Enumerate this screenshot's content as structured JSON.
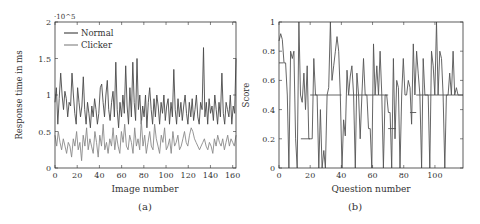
{
  "chart_data": [
    {
      "type": "line",
      "panel_label": "(a)",
      "title": "",
      "xlabel": "Image number",
      "ylabel": "Response time in ms",
      "y_multiplier": "·10^5",
      "xlim": [
        0,
        163
      ],
      "ylim": [
        0,
        2
      ],
      "xticks": [
        0,
        20,
        40,
        60,
        80,
        100,
        120,
        140,
        160
      ],
      "yticks": [
        0,
        0.5,
        1,
        1.5,
        2
      ],
      "ytick_labels": [
        "0",
        "0.5",
        "1",
        "1.5",
        "2"
      ],
      "legend": {
        "position": "upper-left",
        "entries": [
          "Normal",
          "Clicker"
        ]
      },
      "grid": false,
      "series": [
        {
          "name": "Normal",
          "color": "#4a4a4a",
          "values": [
            0.9,
            1.1,
            0.6,
            0.95,
            1.3,
            1.0,
            0.8,
            1.05,
            0.95,
            0.7,
            0.9,
            0.85,
            1.3,
            1.0,
            0.75,
            0.6,
            1.1,
            0.9,
            0.7,
            0.85,
            1.25,
            0.8,
            0.6,
            0.9,
            0.75,
            0.55,
            0.85,
            0.7,
            0.95,
            0.8,
            0.6,
            0.75,
            1.1,
            1.15,
            0.9,
            0.7,
            1.0,
            1.2,
            0.8,
            0.65,
            0.9,
            1.05,
            0.7,
            1.45,
            0.8,
            0.55,
            0.9,
            0.7,
            1.0,
            0.75,
            1.4,
            0.85,
            0.6,
            1.1,
            0.7,
            1.45,
            0.9,
            0.65,
            1.5,
            0.8,
            1.0,
            0.6,
            0.85,
            0.7,
            1.0,
            0.55,
            0.9,
            1.1,
            0.8,
            0.6,
            0.95,
            0.7,
            1.0,
            0.85,
            0.6,
            0.9,
            0.75,
            1.0,
            0.65,
            0.85,
            0.95,
            0.6,
            0.9,
            0.7,
            1.35,
            0.8,
            0.6,
            0.95,
            0.7,
            0.9,
            0.65,
            0.85,
            1.0,
            0.75,
            0.6,
            0.9,
            0.7,
            0.95,
            0.65,
            0.8,
            1.0,
            0.7,
            0.6,
            0.9,
            0.8,
            1.65,
            0.7,
            0.9,
            0.6,
            0.95,
            0.75,
            0.85,
            0.65,
            1.0,
            0.8,
            0.6,
            0.9,
            0.7,
            1.3,
            0.75,
            0.6,
            0.9,
            0.8,
            0.7,
            1.0,
            0.6,
            0.85,
            0.75,
            1.5
          ]
        },
        {
          "name": "Clicker",
          "color": "#8a8a8a",
          "values": [
            0.45,
            0.3,
            0.5,
            0.35,
            0.25,
            0.4,
            0.3,
            0.2,
            0.35,
            0.3,
            0.15,
            0.4,
            0.3,
            0.5,
            0.25,
            0.35,
            0.1,
            0.45,
            0.3,
            0.55,
            0.25,
            0.4,
            0.3,
            0.2,
            0.5,
            0.35,
            0.15,
            0.45,
            0.3,
            0.6,
            0.25,
            0.35,
            0.2,
            0.4,
            0.3,
            0.55,
            0.25,
            0.45,
            0.3,
            0.2,
            0.5,
            0.35,
            0.6,
            0.3,
            0.25,
            0.45,
            0.35,
            0.2,
            0.55,
            0.3,
            0.4,
            0.25,
            0.65,
            0.3,
            0.45,
            0.2,
            0.35,
            0.5,
            0.3,
            0.25,
            0.6,
            0.4,
            0.3,
            0.2,
            0.45,
            0.35,
            0.55,
            0.25,
            0.3,
            0.4,
            0.2,
            0.5,
            0.3,
            0.35,
            0.45,
            0.25,
            0.3,
            0.4,
            0.5,
            0.35,
            0.3,
            0.45,
            0.55,
            0.5,
            0.4,
            0.35,
            0.3,
            0.25,
            0.3,
            0.35,
            0.4,
            0.3,
            0.25,
            0.35,
            0.3,
            0.2,
            0.4,
            0.3,
            0.45,
            0.35,
            0.3,
            0.4,
            0.25,
            0.35,
            0.45,
            0.3,
            0.4,
            0.35,
            0.3,
            0.45
          ]
        }
      ]
    },
    {
      "type": "line",
      "panel_label": "(b)",
      "title": "",
      "xlabel": "Question number",
      "ylabel": "Score",
      "xlim": [
        0,
        118
      ],
      "ylim": [
        0,
        1
      ],
      "xticks": [
        0,
        20,
        40,
        60,
        80,
        100
      ],
      "yticks": [
        0,
        0.2,
        0.4,
        0.6,
        0.8,
        1
      ],
      "ytick_labels": [
        "0",
        "0.2",
        "0.4",
        "0.6",
        "0.8",
        "1"
      ],
      "grid": false,
      "series": [
        {
          "name": "Score",
          "color": "#555555",
          "values": [
            0.87,
            0.92,
            0.88,
            0.72,
            0.72,
            0.5,
            0.0,
            0.8,
            0.75,
            0.8,
            0.2,
            0.0,
            1.0,
            0.5,
            0.45,
            0.65,
            0.4,
            0.7,
            0.2,
            0.2,
            0.2,
            0.75,
            0.5,
            0.5,
            0.0,
            0.4,
            0.0,
            0.12,
            0.0,
            0.5,
            0.55,
            1.0,
            0.6,
            0.7,
            0.8,
            0.9,
            0.8,
            0.5,
            0.0,
            0.33,
            0.22,
            0.67,
            0.5,
            0.63,
            0.7,
            0.5,
            0.0,
            0.65,
            0.5,
            0.2,
            0.5,
            0.75,
            0.5,
            0.5,
            0.27,
            0.27,
            0.0,
            0.85,
            0.5,
            0.7,
            0.5,
            0.8,
            0.5,
            0.0,
            0.5,
            0.5,
            0.38,
            0.38,
            0.0,
            0.75,
            0.2,
            0.6,
            0.55,
            0.0,
            0.5,
            0.75,
            0.5,
            0.5,
            0.6,
            0.55,
            0.3,
            0.85,
            0.5,
            0.8,
            0.65,
            0.5,
            0.0,
            0.75,
            0.5,
            0.5,
            0.5,
            0.0,
            0.8,
            0.7,
            0.5,
            1.0,
            0.5,
            0.8,
            0.75,
            0.5,
            0.0,
            0.5,
            0.5,
            0.65,
            0.5,
            0.8,
            0.5,
            0.55,
            0.5,
            0.5,
            0.5,
            0.5
          ]
        },
        {
          "name": "Step",
          "color": "#555555",
          "segments": [
            {
              "x": [
                0,
                3
              ],
              "y": 0.72
            },
            {
              "x": [
                14,
                20
              ],
              "y": 0.2
            },
            {
              "x": [
                20,
                40
              ],
              "y": 0.5
            },
            {
              "x": [
                44,
                70
              ],
              "y": 0.5
            },
            {
              "x": [
                70,
                75
              ],
              "y": 0.27
            },
            {
              "x": [
                84,
                88
              ],
              "y": 0.38
            },
            {
              "x": [
                88,
                118
              ],
              "y": 0.5
            }
          ]
        }
      ]
    }
  ]
}
